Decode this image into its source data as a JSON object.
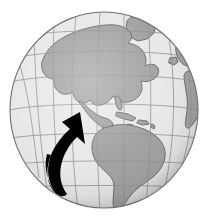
{
  "image": {
    "kind": "globe-illustration",
    "title": "Globe showing the Americas with curved arrow",
    "width": 207,
    "height": 223,
    "background_color": "#ffffff"
  },
  "globe": {
    "name": "earth-globe",
    "center_x": 104,
    "center_y": 110,
    "radius_x": 94,
    "radius_y": 98,
    "ocean_color": "#e7e7e7",
    "land_color": "#9d9d9d",
    "land_border_color": "#595959",
    "graticule_color": "#8d8d8d",
    "outline_color": "#6e6e6e",
    "limb_shadow_color": "#b7b7b7",
    "projection": "orthographic",
    "center_longitude": -75,
    "center_latitude": 8
  },
  "graticule": {
    "name": "lat-lon-grid",
    "latitude_step_degrees": 20,
    "longitude_step_degrees": 20,
    "visible": true
  },
  "landmasses": [
    {
      "name": "north-america",
      "label": "North America"
    },
    {
      "name": "central-america",
      "label": "Central America"
    },
    {
      "name": "south-america",
      "label": "South America"
    },
    {
      "name": "greenland",
      "label": "Greenland"
    },
    {
      "name": "caribbean-islands",
      "label": "Caribbean Islands"
    },
    {
      "name": "west-africa",
      "label": "Africa (west limb)"
    },
    {
      "name": "western-europe",
      "label": "Europe (north-east limb)"
    }
  ],
  "arrow": {
    "name": "curved-arrow",
    "color": "#000000",
    "description": "Thick black curved arrow sweeping up from lower left and pointing to Central America",
    "tail_x": 66,
    "tail_y": 192,
    "tip_x": 80,
    "tip_y": 112,
    "direction": "up-right"
  }
}
